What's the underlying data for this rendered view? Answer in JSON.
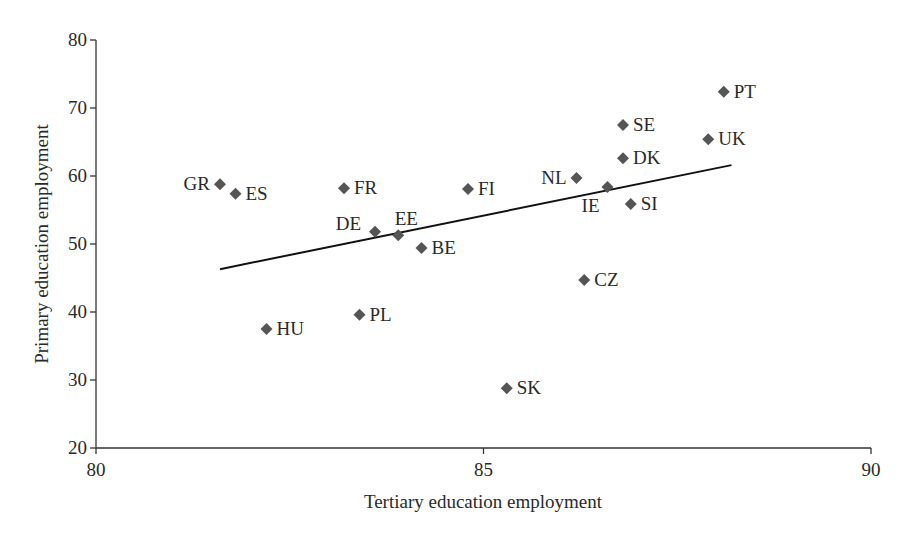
{
  "chart_data": {
    "type": "scatter",
    "title": "",
    "xlabel": "Tertiary education employment",
    "ylabel": "Primary education employment",
    "xlim": [
      80,
      90
    ],
    "ylim": [
      20,
      80
    ],
    "xticks": [
      80,
      85,
      90
    ],
    "yticks": [
      20,
      30,
      40,
      50,
      60,
      70,
      80
    ],
    "grid": false,
    "legend": null,
    "marker": "diamond",
    "marker_color": "#555555",
    "points": [
      {
        "label": "GR",
        "x": 81.6,
        "y": 58.8,
        "label_pos": "left"
      },
      {
        "label": "ES",
        "x": 81.8,
        "y": 57.4,
        "label_pos": "right"
      },
      {
        "label": "FR",
        "x": 83.2,
        "y": 58.2,
        "label_pos": "right"
      },
      {
        "label": "FI",
        "x": 84.8,
        "y": 58.1,
        "label_pos": "right"
      },
      {
        "label": "DE",
        "x": 83.6,
        "y": 51.8,
        "label_pos": "upper-left"
      },
      {
        "label": "EE",
        "x": 83.9,
        "y": 51.3,
        "label_pos": "above"
      },
      {
        "label": "BE",
        "x": 84.2,
        "y": 49.4,
        "label_pos": "right"
      },
      {
        "label": "HU",
        "x": 82.2,
        "y": 37.5,
        "label_pos": "right"
      },
      {
        "label": "PL",
        "x": 83.4,
        "y": 39.6,
        "label_pos": "right"
      },
      {
        "label": "SK",
        "x": 85.3,
        "y": 28.8,
        "label_pos": "right"
      },
      {
        "label": "CZ",
        "x": 86.3,
        "y": 44.7,
        "label_pos": "right"
      },
      {
        "label": "NL",
        "x": 86.2,
        "y": 59.7,
        "label_pos": "left"
      },
      {
        "label": "IE",
        "x": 86.6,
        "y": 58.4,
        "label_pos": "below-left"
      },
      {
        "label": "SI",
        "x": 86.9,
        "y": 55.9,
        "label_pos": "right"
      },
      {
        "label": "DK",
        "x": 86.8,
        "y": 62.6,
        "label_pos": "right"
      },
      {
        "label": "SE",
        "x": 86.8,
        "y": 67.5,
        "label_pos": "right"
      },
      {
        "label": "UK",
        "x": 87.9,
        "y": 65.4,
        "label_pos": "right"
      },
      {
        "label": "PT",
        "x": 88.1,
        "y": 72.4,
        "label_pos": "right"
      }
    ],
    "trendline": {
      "type": "linear",
      "start": {
        "x": 81.6,
        "y": 46.3
      },
      "end": {
        "x": 88.2,
        "y": 61.6
      }
    }
  }
}
